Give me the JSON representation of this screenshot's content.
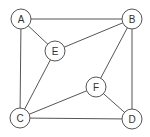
{
  "graph": {
    "nodes": [
      {
        "id": "A",
        "label": "A",
        "x": 21,
        "y": 19
      },
      {
        "id": "B",
        "label": "B",
        "x": 132,
        "y": 19
      },
      {
        "id": "C",
        "label": "C",
        "x": 20,
        "y": 118
      },
      {
        "id": "D",
        "label": "D",
        "x": 132,
        "y": 119
      },
      {
        "id": "E",
        "label": "E",
        "x": 55,
        "y": 51
      },
      {
        "id": "F",
        "label": "F",
        "x": 96,
        "y": 87
      }
    ],
    "edges": [
      [
        "A",
        "B"
      ],
      [
        "A",
        "E"
      ],
      [
        "A",
        "C"
      ],
      [
        "E",
        "B"
      ],
      [
        "E",
        "C"
      ],
      [
        "B",
        "F"
      ],
      [
        "B",
        "D"
      ],
      [
        "F",
        "C"
      ],
      [
        "F",
        "D"
      ],
      [
        "C",
        "D"
      ]
    ],
    "node_radius": 10,
    "stroke_color": "#555555"
  }
}
